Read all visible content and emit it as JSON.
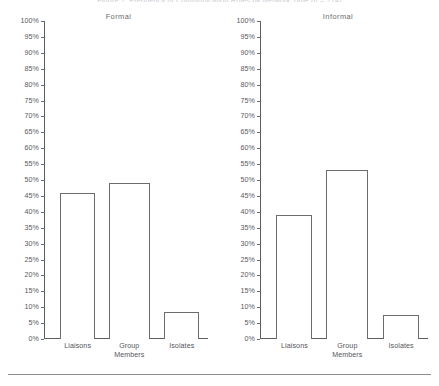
{
  "figure": {
    "clipped_title": "Figure 1. Frequency of Communication Roles by Network Type (n = 214)",
    "footer_rule": true
  },
  "chart_data": {
    "type": "bar",
    "title": "Figure 1. Frequency of Communication Roles by Network Type (n = 214)",
    "xlabel": "",
    "ylabel": "",
    "ylim": [
      0,
      100
    ],
    "grid": false,
    "legend": "none",
    "panels": [
      {
        "name": "Formal",
        "categories": [
          "Liaisons",
          "Group Members",
          "Isolates"
        ],
        "values": [
          46,
          49,
          8.5
        ]
      },
      {
        "name": "Informal",
        "categories": [
          "Liaisons",
          "Group Members",
          "Isolates"
        ],
        "values": [
          39,
          53,
          7.5
        ]
      }
    ],
    "ytick_labels": [
      "100%",
      "95%",
      "90%",
      "85%",
      "80%",
      "75%",
      "70%",
      "65%",
      "60%",
      "55%",
      "50%",
      "45%",
      "40%",
      "35%",
      "30%",
      "25%",
      "20%",
      "15%",
      "10%",
      "5%",
      "0%"
    ],
    "ytick_values": [
      100,
      95,
      90,
      85,
      80,
      75,
      70,
      65,
      60,
      55,
      50,
      45,
      40,
      35,
      30,
      25,
      20,
      15,
      10,
      5,
      0
    ],
    "colors": {
      "bar_outline": "#6b6b70",
      "bar_fill": "#ffffff",
      "axis": "#5d5d5d",
      "text": "#55555b"
    }
  },
  "category_lines": [
    [
      "Liaisons",
      ""
    ],
    [
      "Group",
      "Members"
    ],
    [
      "Isolates",
      ""
    ]
  ]
}
